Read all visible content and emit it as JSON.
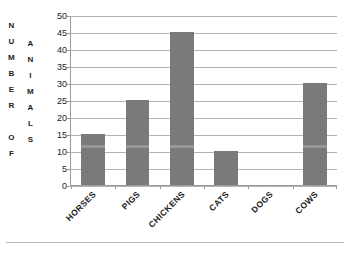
{
  "figure": {
    "title_faint": "",
    "background_color": "#ffffff",
    "bar_color": "#7a7a7a",
    "grid_color": "#b4b4b4",
    "axis_color": "#9a9a9a",
    "y_axis_title_lines": [
      "NUMBER OF",
      "ANIMALS"
    ],
    "y_axis_title_outer_letters": [
      "N",
      "U",
      "M",
      "B",
      "E",
      "R",
      "",
      "O",
      "F"
    ],
    "y_axis_title_inner_letters": [
      "A",
      "N",
      "I",
      "M",
      "A",
      "L",
      "S"
    ]
  },
  "chart_data": {
    "type": "bar",
    "title": "",
    "xlabel": "",
    "ylabel": "NUMBER OF ANIMALS",
    "categories": [
      "HORSES",
      "PIGS",
      "CHICKENS",
      "CATS",
      "DOGS",
      "COWS"
    ],
    "values": [
      15,
      25,
      45,
      10,
      0,
      30
    ],
    "ylim": [
      0,
      50
    ],
    "ytick_step": 5,
    "yticks": [
      50,
      45,
      40,
      35,
      30,
      25,
      20,
      15,
      10,
      5,
      0
    ],
    "ytick_labels": [
      "50",
      "45",
      "40",
      "35",
      "30",
      "25",
      "20",
      "15",
      "10",
      "5",
      "0"
    ],
    "grid": true,
    "grid_axis": "y",
    "legend": false,
    "legend_position": "none",
    "series": [
      {
        "name": "Number of animals",
        "values": [
          15,
          25,
          45,
          10,
          0,
          30
        ]
      }
    ]
  }
}
